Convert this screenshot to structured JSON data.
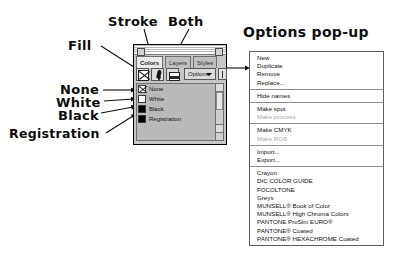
{
  "annotations": {
    "fill": "Fill",
    "stroke": "Stroke",
    "both": "Both",
    "none": "None",
    "white": "White",
    "black": "Black",
    "registration": "Registration"
  },
  "palette": {
    "tabs": [
      {
        "label": "Colors",
        "active": true
      },
      {
        "label": "Layers",
        "active": false
      },
      {
        "label": "Styles",
        "active": false
      }
    ],
    "toolbar": {
      "fill_button": "fill-swatch",
      "stroke_button": "stroke-swatch",
      "both_button": "both-swatch",
      "options_label": "Options"
    },
    "swatches": [
      {
        "label": "None",
        "kind": "none"
      },
      {
        "label": "White",
        "kind": "white"
      },
      {
        "label": "Black",
        "kind": "black"
      },
      {
        "label": "Registration",
        "kind": "reg"
      }
    ]
  },
  "popup": {
    "title": "Options pop-up",
    "groups": [
      {
        "items": [
          {
            "label": "New",
            "disabled": false
          },
          {
            "label": "Duplicate",
            "disabled": false
          },
          {
            "label": "Remove",
            "disabled": false
          },
          {
            "label": "Replace...",
            "disabled": false
          }
        ]
      },
      {
        "items": [
          {
            "label": "Hide names",
            "disabled": false
          }
        ]
      },
      {
        "items": [
          {
            "label": "Make spot",
            "disabled": false
          },
          {
            "label": "Make process",
            "disabled": true
          }
        ]
      },
      {
        "items": [
          {
            "label": "Make CMYK",
            "disabled": false
          },
          {
            "label": "Make RGB",
            "disabled": true
          }
        ]
      },
      {
        "items": [
          {
            "label": "Import...",
            "disabled": false
          },
          {
            "label": "Export...",
            "disabled": false
          }
        ]
      },
      {
        "items": [
          {
            "label": "Crayon",
            "disabled": false
          },
          {
            "label": "DIC COLOR GUIDE",
            "disabled": false
          },
          {
            "label": "FOCOLTONE",
            "disabled": false
          },
          {
            "label": "Greys",
            "disabled": false
          },
          {
            "label": "MUNSELL® Book of Color",
            "disabled": false
          },
          {
            "label": "MUNSELL® High Chroma Colors",
            "disabled": false
          },
          {
            "label": "PANTONE ProSim EURO®",
            "disabled": false
          },
          {
            "label": "PANTONE® Coated",
            "disabled": false
          },
          {
            "label": "PANTONE® HEXACHROME Coated",
            "disabled": false
          }
        ]
      }
    ]
  },
  "colors": {
    "ink": "#0d0d0d",
    "palette_bg": "#c6c6c6",
    "list_bg": "#b9b9b9",
    "menu_bg": "#ffffff",
    "disabled_text": "#a9a9a9"
  }
}
